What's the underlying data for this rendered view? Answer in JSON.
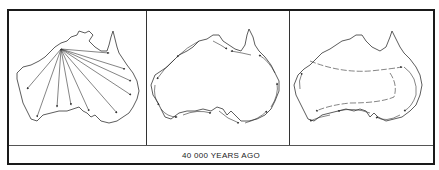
{
  "figure": {
    "caption": "40 000 YEARS AGO",
    "panels": [
      {
        "id": "panel-1",
        "description": "Radial spread from northwest Kimberley across the continent"
      },
      {
        "id": "panel-2",
        "description": "Coastal migration around the perimeter of Australia"
      },
      {
        "id": "panel-3",
        "description": "Coastal and inland river-route migration"
      }
    ]
  },
  "colors": {
    "line": "#333333",
    "border": "#1a1a1a",
    "background": "#ffffff"
  }
}
